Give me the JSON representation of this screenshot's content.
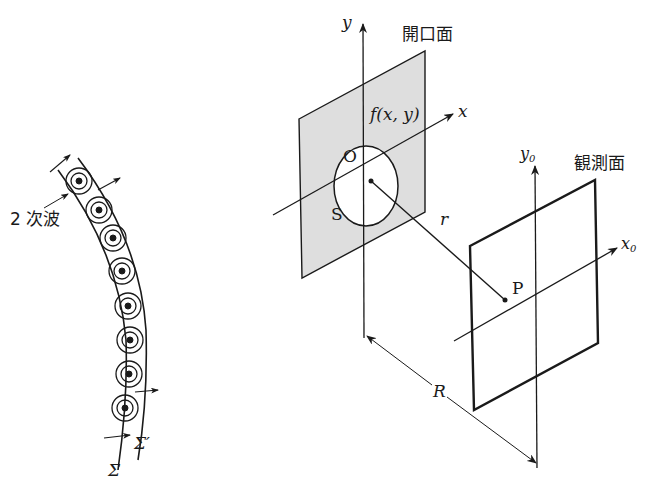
{
  "figure": {
    "left_panel": {
      "secondary_wave_label": "2 次波",
      "wavefront_sigma_label": "Σ",
      "wavefront_sigma_prime_label": "Σ′",
      "secondary_wave_count": 8
    },
    "right_panel": {
      "aperture_plane_label": "開口面",
      "observation_plane_label": "観測面",
      "y_axis_label": "y",
      "x_axis_label": "x",
      "y0_axis_label": "y",
      "y0_subscript": "0",
      "x0_axis_label": "x",
      "x0_subscript": "0",
      "aperture_function_label": "f(x, y)",
      "origin_label": "O",
      "aperture_region_label": "S",
      "distance_r_label": "r",
      "point_p_label": "P",
      "distance_R_label": "R"
    }
  },
  "colors": {
    "line": "#1a1a1a",
    "aperture_fill": "#dedede",
    "background": "#ffffff"
  }
}
